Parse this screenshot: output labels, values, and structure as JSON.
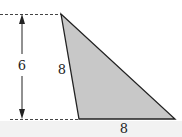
{
  "diagram": {
    "shape": "triangle",
    "fill_color": "#c8c8c8",
    "stroke_color": "#222222",
    "labels": {
      "height": "6",
      "left_side": "8",
      "base": "8"
    }
  }
}
